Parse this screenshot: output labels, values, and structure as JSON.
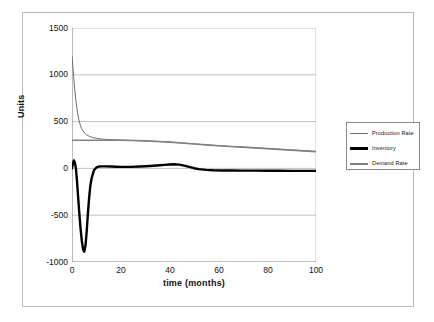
{
  "chart_data": {
    "type": "line",
    "title": "",
    "xlabel": "time  (months)",
    "ylabel": "Units",
    "xlim": [
      0,
      100
    ],
    "ylim": [
      -1000,
      1500
    ],
    "xticks": [
      "0",
      "20",
      "40",
      "60",
      "80",
      "100"
    ],
    "yticks": [
      "1500",
      "1000",
      "500",
      "0",
      "-500",
      "-1000"
    ],
    "grid": "horizontal",
    "legend_position": "right",
    "colors": {
      "production_rate": "#6e6e6e",
      "inventory": "#000000",
      "demand_rate": "#808080",
      "gridline": "#a9a9a9",
      "axis": "#808080",
      "frame": "#b9b9b9"
    },
    "series": [
      {
        "name": "Production Rate",
        "color": "#6e6e6e",
        "width": 1,
        "x": [
          0,
          0.5,
          1,
          1.5,
          2,
          2.5,
          3,
          3.5,
          4,
          4.5,
          5,
          6,
          7,
          8,
          9,
          10,
          12,
          14,
          16,
          18,
          20,
          25,
          30,
          35,
          40,
          45,
          50,
          55,
          60,
          65,
          70,
          75,
          80,
          85,
          90,
          95,
          100
        ],
        "y": [
          1200,
          1040,
          880,
          745,
          640,
          560,
          500,
          455,
          424,
          400,
          382,
          358,
          344,
          334,
          327,
          322,
          314,
          310,
          307,
          305,
          303,
          299,
          295,
          289,
          282,
          272,
          262,
          252,
          243,
          235,
          228,
          220,
          212,
          204,
          196,
          188,
          180
        ]
      },
      {
        "name": "Inventory",
        "color": "#000000",
        "width": 2.4,
        "x": [
          0,
          0.4,
          0.8,
          1.2,
          1.6,
          2,
          2.5,
          3,
          3.5,
          4,
          4.5,
          5,
          5.5,
          6,
          6.5,
          7,
          7.5,
          8,
          9,
          10,
          11,
          12,
          14,
          16,
          18,
          20,
          24,
          28,
          32,
          36,
          38,
          40,
          42,
          44,
          46,
          48,
          50,
          52,
          55,
          58,
          62,
          66,
          70,
          75,
          80,
          85,
          90,
          95,
          100
        ],
        "y": [
          0,
          60,
          85,
          60,
          0,
          -120,
          -300,
          -480,
          -640,
          -770,
          -860,
          -890,
          -830,
          -680,
          -490,
          -320,
          -190,
          -110,
          -20,
          10,
          20,
          22,
          22,
          20,
          18,
          16,
          16,
          20,
          26,
          34,
          38,
          42,
          44,
          40,
          30,
          16,
          2,
          -8,
          -16,
          -20,
          -22,
          -23,
          -24,
          -24,
          -25,
          -25,
          -26,
          -26,
          -26
        ]
      },
      {
        "name": "Demand Rate",
        "color": "#808080",
        "width": 1.6,
        "x": [
          0,
          2,
          4,
          6,
          8,
          10,
          14,
          18,
          20,
          25,
          30,
          35,
          40,
          45,
          50,
          55,
          60,
          65,
          70,
          75,
          80,
          85,
          90,
          95,
          100
        ],
        "y": [
          300,
          300,
          300,
          300,
          300,
          300,
          300,
          301,
          301,
          298,
          294,
          288,
          281,
          271,
          261,
          251,
          242,
          234,
          227,
          219,
          211,
          203,
          195,
          187,
          179
        ]
      }
    ]
  },
  "axis": {
    "y_title": "Units",
    "x_title": "time  (months)",
    "y_ticks": [
      "1500",
      "1000",
      "500",
      "0",
      "-500",
      "-1000"
    ],
    "x_ticks": [
      "0",
      "20",
      "40",
      "60",
      "80",
      "100"
    ]
  },
  "legend": {
    "items": [
      {
        "label": "Production Rate",
        "color": "#6e6e6e",
        "thickness": "1px"
      },
      {
        "label": "Inventory",
        "color": "#000000",
        "thickness": "3px"
      },
      {
        "label": "Demand Rate",
        "color": "#808080",
        "thickness": "2px"
      }
    ]
  }
}
